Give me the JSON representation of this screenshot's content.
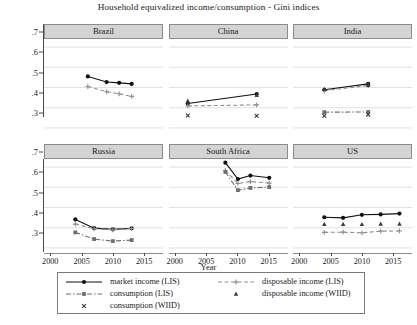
{
  "chart_data": {
    "type": "line",
    "title": "Household equivalized income/consumption - Gini indices",
    "xlabel": "Year",
    "ylabel": "",
    "xlim": [
      1999,
      2018
    ],
    "ylim": [
      0.28,
      0.74
    ],
    "xticks": [
      2000,
      2005,
      2010,
      2015
    ],
    "yticks": [
      0.3,
      0.4,
      0.5,
      0.6,
      0.7
    ],
    "ytick_labels": [
      ".3",
      ".4",
      ".5",
      ".6",
      ".7"
    ],
    "xtick_labels": [
      "2000",
      "2005",
      "2010",
      "2015"
    ],
    "grid": true,
    "grid_axis": "y",
    "legend_position": "bottom",
    "layout": {
      "rows": 2,
      "cols": 3
    },
    "panels": [
      {
        "name": "Brazil",
        "row": 0,
        "col": 0,
        "series": [
          {
            "name": "market income (LIS)",
            "x": [
              2006,
              2009,
              2011,
              2013
            ],
            "values": [
              0.555,
              0.527,
              0.523,
              0.518
            ]
          },
          {
            "name": "disposable income (LIS)",
            "x": [
              2006,
              2009,
              2011,
              2013
            ],
            "values": [
              0.505,
              0.479,
              0.469,
              0.456
            ]
          }
        ]
      },
      {
        "name": "China",
        "row": 0,
        "col": 1,
        "series": [
          {
            "name": "market income (LIS)",
            "x": [
              2002,
              2013
            ],
            "values": [
              0.421,
              0.468
            ]
          },
          {
            "name": "disposable income (LIS)",
            "x": [
              2002,
              2013
            ],
            "values": [
              0.409,
              0.414
            ]
          },
          {
            "name": "disposable income (WIID)",
            "x": [
              2002,
              2013
            ],
            "values": [
              0.434,
              0.462
            ]
          },
          {
            "name": "consumption (WIID)",
            "x": [
              2002,
              2013
            ],
            "values": [
              0.362,
              0.36
            ]
          }
        ]
      },
      {
        "name": "India",
        "row": 0,
        "col": 2,
        "series": [
          {
            "name": "market income (LIS)",
            "x": [
              2004,
              2011
            ],
            "values": [
              0.489,
              0.518
            ]
          },
          {
            "name": "disposable income (LIS)",
            "x": [
              2004,
              2011
            ],
            "values": [
              0.484,
              0.51
            ]
          },
          {
            "name": "disposable income (WIID)",
            "x": [
              2004,
              2011
            ],
            "values": [
              0.492,
              0.512
            ]
          },
          {
            "name": "consumption (LIS)",
            "x": [
              2004,
              2011
            ],
            "values": [
              0.378,
              0.379
            ]
          },
          {
            "name": "consumption (WIID)",
            "x": [
              2004,
              2011
            ],
            "values": [
              0.36,
              0.366
            ]
          }
        ]
      },
      {
        "name": "Russia",
        "row": 1,
        "col": 0,
        "series": [
          {
            "name": "market income (LIS)",
            "x": [
              2004,
              2007,
              2010,
              2013
            ],
            "values": [
              0.441,
              0.398,
              0.392,
              0.397
            ]
          },
          {
            "name": "disposable income (LIS)",
            "x": [
              2004,
              2007,
              2010,
              2013
            ],
            "values": [
              0.418,
              0.395,
              0.39,
              0.396
            ]
          },
          {
            "name": "consumption (LIS)",
            "x": [
              2004,
              2007,
              2010,
              2013
            ],
            "values": [
              0.377,
              0.344,
              0.334,
              0.339
            ]
          }
        ]
      },
      {
        "name": "South Africa",
        "row": 1,
        "col": 1,
        "series": [
          {
            "name": "market income (LIS)",
            "x": [
              2008,
              2010,
              2012,
              2015
            ],
            "values": [
              0.722,
              0.641,
              0.658,
              0.647
            ]
          },
          {
            "name": "disposable income (LIS)",
            "x": [
              2008,
              2010,
              2012,
              2015
            ],
            "values": [
              0.683,
              0.619,
              0.628,
              0.621
            ]
          },
          {
            "name": "consumption (LIS)",
            "x": [
              2008,
              2010,
              2012,
              2015
            ],
            "values": [
              0.676,
              0.586,
              0.597,
              0.601
            ]
          }
        ]
      },
      {
        "name": "US",
        "row": 1,
        "col": 2,
        "series": [
          {
            "name": "market income (LIS)",
            "x": [
              2004,
              2007,
              2010,
              2013,
              2016
            ],
            "values": [
              0.452,
              0.449,
              0.464,
              0.466,
              0.47
            ]
          },
          {
            "name": "disposable income (LIS)",
            "x": [
              2004,
              2007,
              2010,
              2013,
              2016
            ],
            "values": [
              0.377,
              0.378,
              0.375,
              0.383,
              0.384
            ]
          },
          {
            "name": "disposable income (WIID)",
            "x": [
              2004,
              2007,
              2010,
              2013,
              2016
            ],
            "values": [
              0.418,
              0.418,
              0.417,
              0.419,
              0.419
            ]
          }
        ]
      }
    ],
    "legend": [
      {
        "label": "market income (LIS)",
        "style": "solid-circle"
      },
      {
        "label": "disposable income (LIS)",
        "style": "dashed-plus"
      },
      {
        "label": "consumption (LIS)",
        "style": "dashdot-square"
      },
      {
        "label": "disposable income (WIID)",
        "style": "triangle"
      },
      {
        "label": "consumption (WIID)",
        "style": "cross"
      }
    ],
    "colors": {
      "market_income": "#111111",
      "disposable_income": "#8f8f8f",
      "consumption": "#6e6e6e",
      "panel_strip": "#d4d4d4",
      "grid": "#d9d9d9",
      "axis": "#4a4a4a"
    }
  }
}
